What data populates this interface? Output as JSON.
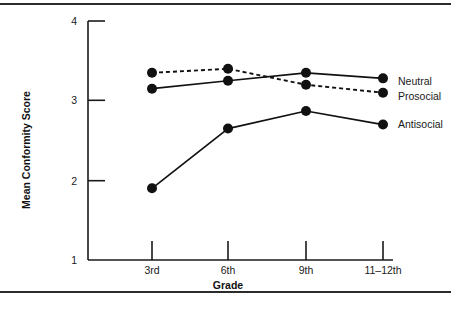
{
  "chart_data": {
    "type": "line",
    "title": "",
    "xlabel": "Grade",
    "ylabel": "Mean Conformity Score",
    "categories": [
      "3rd",
      "6th",
      "9th",
      "11–12th"
    ],
    "ylim": [
      1,
      4
    ],
    "yticks": [
      "1",
      "2",
      "3",
      "4"
    ],
    "grid": false,
    "legend_position": "right-inline-labels",
    "series": [
      {
        "name": "Neutral",
        "style": "solid",
        "marker": "filled-circle",
        "values": [
          3.15,
          3.25,
          3.35,
          3.28
        ]
      },
      {
        "name": "Prosocial",
        "style": "dotted",
        "marker": "filled-circle",
        "values": [
          3.35,
          3.4,
          3.2,
          3.1
        ]
      },
      {
        "name": "Antisocial",
        "style": "solid",
        "marker": "filled-circle",
        "values": [
          1.9,
          2.65,
          2.87,
          2.7
        ]
      }
    ],
    "colors": {
      "line": "#111111",
      "marker": "#111111",
      "axis": "#1a1a1a",
      "background": "#ffffff",
      "rule": "#2b2b2b"
    }
  },
  "axis": {
    "y_tick_4": "4",
    "y_tick_3": "3",
    "y_tick_2": "2",
    "y_tick_1": "1",
    "x_tick_0": "3rd",
    "x_tick_1": "6th",
    "x_tick_2": "9th",
    "x_tick_3": "11–12th",
    "x_title": "Grade",
    "y_title": "Mean Conformity Score"
  },
  "series_labels": {
    "neutral": "Neutral",
    "prosocial": "Prosocial",
    "antisocial": "Antisocial"
  }
}
